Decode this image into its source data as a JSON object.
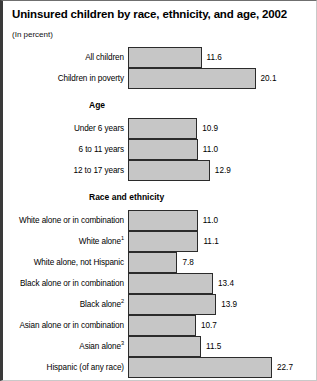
{
  "figure": {
    "title": "Uninsured children by race, ethnicity, and age, 2002",
    "subtitle": "(In percent)"
  },
  "groups": [
    {
      "header": "",
      "rows": [
        {
          "label": "All children",
          "sup": "",
          "value": 11.6,
          "value_label": "11.6"
        },
        {
          "label": "Children in poverty",
          "sup": "",
          "value": 20.1,
          "value_label": "20.1"
        }
      ]
    },
    {
      "header": "Age",
      "rows": [
        {
          "label": "Under 6 years",
          "sup": "",
          "value": 10.9,
          "value_label": "10.9"
        },
        {
          "label": "6 to 11 years",
          "sup": "",
          "value": 11.0,
          "value_label": "11.0"
        },
        {
          "label": "12 to 17 years",
          "sup": "",
          "value": 12.9,
          "value_label": "12.9"
        }
      ]
    },
    {
      "header": "Race and ethnicity",
      "rows": [
        {
          "label": "White alone or in combination",
          "sup": "",
          "value": 11.0,
          "value_label": "11.0"
        },
        {
          "label": "White alone",
          "sup": "1",
          "value": 11.1,
          "value_label": "11.1"
        },
        {
          "label": "White alone, not Hispanic",
          "sup": "",
          "value": 7.8,
          "value_label": "7.8"
        },
        {
          "label": "Black alone or in combination",
          "sup": "",
          "value": 13.4,
          "value_label": "13.4"
        },
        {
          "label": "Black alone",
          "sup": "2",
          "value": 13.9,
          "value_label": "13.9"
        },
        {
          "label": "Asian alone or in combination",
          "sup": "",
          "value": 10.7,
          "value_label": "10.7"
        },
        {
          "label": "Asian alone",
          "sup": "3",
          "value": 11.5,
          "value_label": "11.5"
        },
        {
          "label": "Hispanic (of any race)",
          "sup": "",
          "value": 22.7,
          "value_label": "22.7"
        }
      ]
    }
  ],
  "chart_data": {
    "type": "bar",
    "orientation": "horizontal",
    "title": "Uninsured children by race, ethnicity, and age, 2002",
    "subtitle": "(In percent)",
    "xlabel": "",
    "ylabel": "",
    "unit": "percent",
    "xlim": [
      0,
      22.7
    ],
    "grid": false,
    "legend": "none",
    "bar_color": "#c6c6c6",
    "bar_outline_color": "#2b2b2b",
    "group_headers": [
      "",
      "Age",
      "Race and ethnicity"
    ],
    "categories": [
      "All children",
      "Children in poverty",
      "Under 6 years",
      "6 to 11 years",
      "12 to 17 years",
      "White alone or in combination",
      "White alone¹",
      "White alone, not Hispanic",
      "Black alone or in combination",
      "Black alone²",
      "Asian alone or in combination",
      "Asian alone³",
      "Hispanic (of any race)"
    ],
    "values": [
      11.6,
      20.1,
      10.9,
      11.0,
      12.9,
      11.0,
      11.1,
      7.8,
      13.4,
      13.9,
      10.7,
      11.5,
      22.7
    ],
    "groups": [
      {
        "name": "",
        "categories": [
          "All children",
          "Children in poverty"
        ],
        "values": [
          11.6,
          20.1
        ]
      },
      {
        "name": "Age",
        "categories": [
          "Under 6 years",
          "6 to 11 years",
          "12 to 17 years"
        ],
        "values": [
          10.9,
          11.0,
          12.9
        ]
      },
      {
        "name": "Race and ethnicity",
        "categories": [
          "White alone or in combination",
          "White alone¹",
          "White alone, not Hispanic",
          "Black alone or in combination",
          "Black alone²",
          "Asian alone or in combination",
          "Asian alone³",
          "Hispanic (of any race)"
        ],
        "values": [
          11.0,
          11.1,
          7.8,
          13.4,
          13.9,
          10.7,
          11.5,
          22.7
        ]
      }
    ]
  }
}
